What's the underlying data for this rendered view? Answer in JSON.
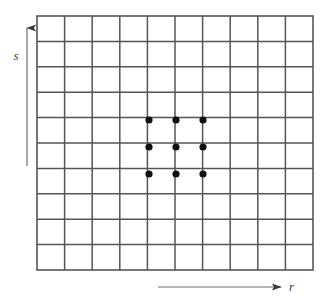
{
  "figure": {
    "background_color": "#ffffff",
    "width": 336,
    "height": 305
  },
  "grid": {
    "name": "coordinate-grid",
    "columns": 10,
    "rows": 10,
    "origin_x": 37,
    "origin_y": 16,
    "cell_width": 27.6,
    "cell_height": 25.4,
    "line_color": "#555555",
    "line_width": 1.5,
    "border_color": "#555555",
    "border_width": 1.6,
    "fill_color": "#ffffff"
  },
  "points": {
    "name": "highlighted-neighborhood-points",
    "count": 9,
    "radius": 3.6,
    "color": "#111111",
    "arrangement": "3x3",
    "coordinates": [
      {
        "label": "p1",
        "x": 149,
        "y": 120,
        "col": 4,
        "row": 4
      },
      {
        "label": "p2",
        "x": 176,
        "y": 120,
        "col": 5,
        "row": 4
      },
      {
        "label": "p3",
        "x": 203,
        "y": 120,
        "col": 6,
        "row": 4
      },
      {
        "label": "p4",
        "x": 149,
        "y": 147,
        "col": 4,
        "row": 5
      },
      {
        "label": "p5",
        "x": 176,
        "y": 147,
        "col": 5,
        "row": 5
      },
      {
        "label": "p6",
        "x": 203,
        "y": 147,
        "col": 6,
        "row": 5
      },
      {
        "label": "p7",
        "x": 149,
        "y": 174,
        "col": 4,
        "row": 6
      },
      {
        "label": "p8",
        "x": 176,
        "y": 174,
        "col": 5,
        "row": 6
      },
      {
        "label": "p9",
        "x": 203,
        "y": 174,
        "col": 6,
        "row": 6
      }
    ]
  },
  "axes": {
    "vertical": {
      "name": "s-axis",
      "label": "s",
      "direction": "up",
      "x": 27,
      "y_start": 166,
      "y_end": 28,
      "color": "#6b6b6b",
      "line_width": 1.2,
      "label_x": 16,
      "label_y": 60
    },
    "horizontal": {
      "name": "r-axis",
      "label": "r",
      "direction": "right",
      "y": 287,
      "x_start": 158,
      "x_end": 281,
      "color": "#6b6b6b",
      "line_width": 1.2,
      "label_x": 289,
      "label_y": 291
    }
  },
  "chart_data": {
    "type": "scatter",
    "title": "",
    "xlabel": "r",
    "ylabel": "s",
    "grid": true,
    "legend": false,
    "x": [
      4,
      5,
      6,
      4,
      5,
      6,
      4,
      5,
      6
    ],
    "y": [
      4,
      4,
      4,
      5,
      5,
      5,
      6,
      6,
      6
    ],
    "xlim": [
      0,
      10
    ],
    "ylim": [
      0,
      10
    ],
    "xticks": [
      0,
      1,
      2,
      3,
      4,
      5,
      6,
      7,
      8,
      9,
      10
    ],
    "yticks": [
      0,
      1,
      2,
      3,
      4,
      5,
      6,
      7,
      8,
      9,
      10
    ],
    "xticklabels": [
      "",
      "",
      "",
      "",
      "",
      "",
      "",
      "",
      "",
      "",
      ""
    ],
    "yticklabels": [
      "",
      "",
      "",
      "",
      "",
      "",
      "",
      "",
      "",
      "",
      ""
    ],
    "series": [
      {
        "name": "neighborhood",
        "marker": "filled-circle",
        "color": "#111111",
        "values": [
          [
            4,
            4
          ],
          [
            5,
            4
          ],
          [
            6,
            4
          ],
          [
            4,
            5
          ],
          [
            5,
            5
          ],
          [
            6,
            5
          ],
          [
            4,
            6
          ],
          [
            5,
            6
          ],
          [
            6,
            6
          ]
        ]
      }
    ]
  }
}
